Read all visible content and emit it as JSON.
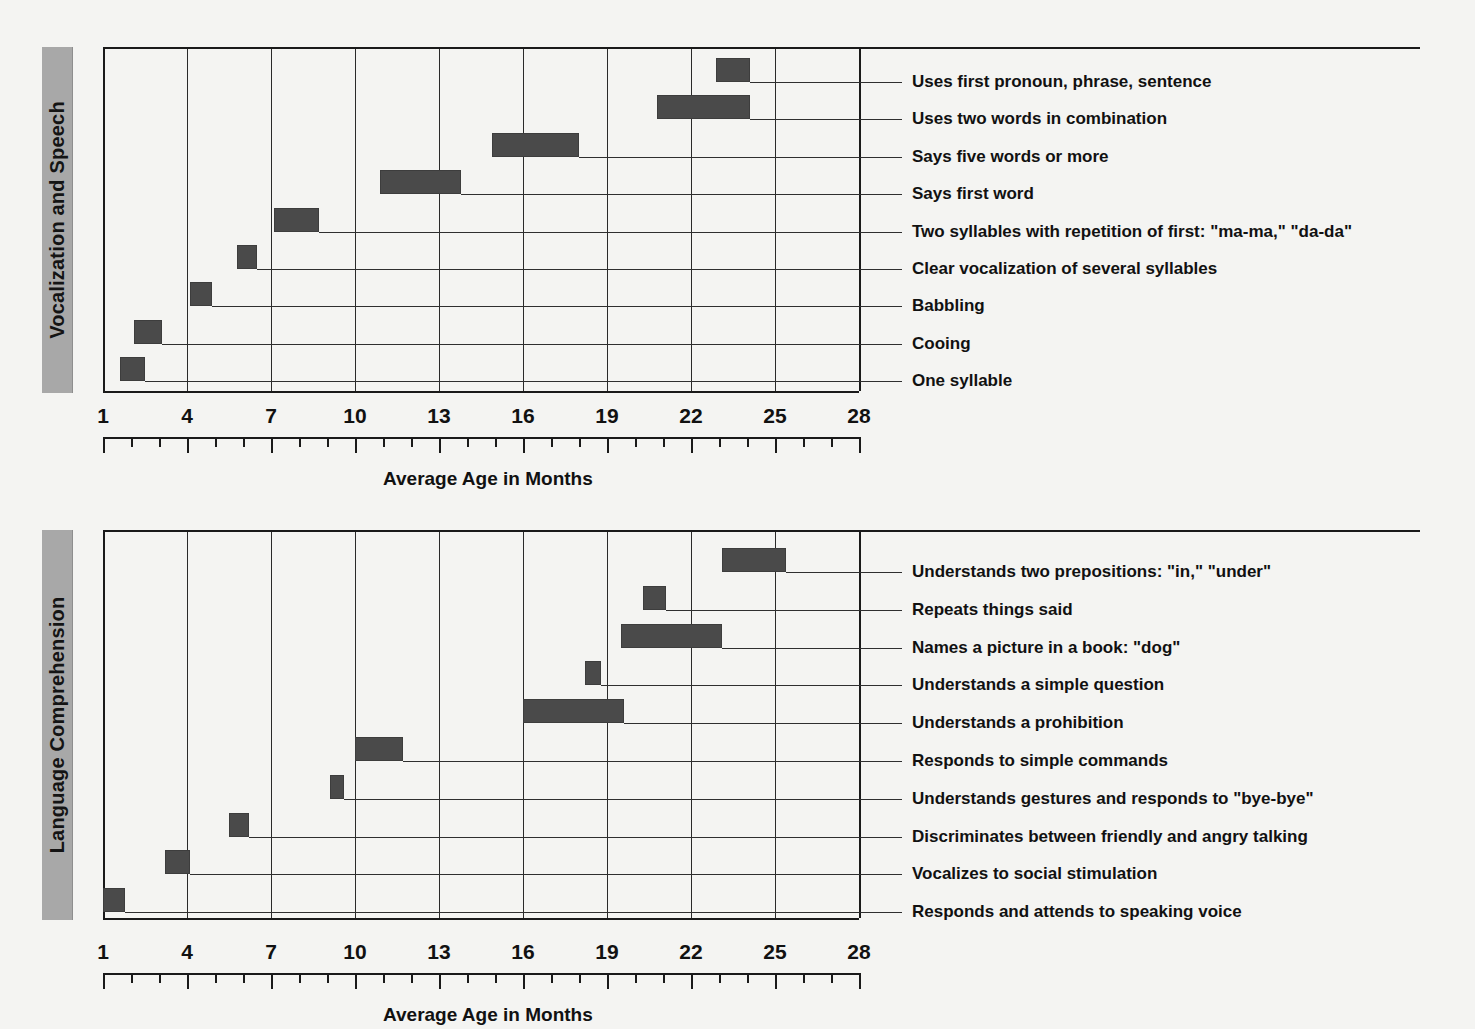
{
  "page": {
    "top_clipped_text": "",
    "background": "#f4f4f2",
    "bar_color": "#4a4a4a",
    "banner_color": "#a8a8a8",
    "axis_color": "#1a1a1a"
  },
  "axis": {
    "title": "Average Age in Months",
    "tick_labels": [
      "1",
      "4",
      "7",
      "10",
      "13",
      "16",
      "19",
      "22",
      "25",
      "28"
    ],
    "min": 1,
    "max": 28,
    "major_step": 3,
    "minor_step": 1
  },
  "charts": [
    {
      "id": "vocalization-and-speech",
      "category": "Vocalization and Speech",
      "rows": [
        {
          "label": "Uses first pronoun, phrase, sentence",
          "start": 22.9,
          "end": 24.1
        },
        {
          "label": "Uses two words in combination",
          "start": 20.8,
          "end": 24.1
        },
        {
          "label": "Says five words or more",
          "start": 14.9,
          "end": 18.0
        },
        {
          "label": "Says first word",
          "start": 10.9,
          "end": 13.8
        },
        {
          "label": "Two syllables with repetition of first: \"ma-ma,\" \"da-da\"",
          "start": 7.1,
          "end": 8.7
        },
        {
          "label": "Clear vocalization of several syllables",
          "start": 5.8,
          "end": 6.5
        },
        {
          "label": "Babbling",
          "start": 4.1,
          "end": 4.9
        },
        {
          "label": "Cooing",
          "start": 2.1,
          "end": 3.1
        },
        {
          "label": "One syllable",
          "start": 1.6,
          "end": 2.5
        }
      ]
    },
    {
      "id": "language-comprehension",
      "category": "Language Comprehension",
      "rows": [
        {
          "label": "Understands two prepositions: \"in,\" \"under\"",
          "start": 23.1,
          "end": 25.4
        },
        {
          "label": "Repeats things said",
          "start": 20.3,
          "end": 21.1
        },
        {
          "label": "Names a picture in a book: \"dog\"",
          "start": 19.5,
          "end": 23.1
        },
        {
          "label": "Understands a simple question",
          "start": 18.2,
          "end": 18.8
        },
        {
          "label": "Understands a prohibition",
          "start": 16.0,
          "end": 19.6
        },
        {
          "label": "Responds to simple commands",
          "start": 10.0,
          "end": 11.7
        },
        {
          "label": "Understands gestures and responds to \"bye-bye\"",
          "start": 9.1,
          "end": 9.6
        },
        {
          "label": "Discriminates between friendly and angry talking",
          "start": 5.5,
          "end": 6.2
        },
        {
          "label": "Vocalizes to social stimulation",
          "start": 3.2,
          "end": 4.1
        },
        {
          "label": "Responds and attends to speaking voice",
          "start": 1.0,
          "end": 1.8
        }
      ]
    }
  ],
  "chart_data": {
    "type": "bar",
    "orientation": "horizontal",
    "subtype": "range-bar",
    "title": "",
    "xlabel": "Average Age in Months",
    "ylabel": "",
    "xlim": [
      1,
      28
    ],
    "xticks": [
      1,
      4,
      7,
      10,
      13,
      16,
      19,
      22,
      25,
      28
    ],
    "minor_ticks_every": 1,
    "grid": "vertical-major-only",
    "legend": "none",
    "panels": [
      {
        "name": "Vocalization and Speech",
        "categories": [
          "Uses first pronoun, phrase, sentence",
          "Uses two words in combination",
          "Says five words or more",
          "Says first word",
          "Two syllables with repetition of first: \"ma-ma,\" \"da-da\"",
          "Clear vocalization of several syllables",
          "Babbling",
          "Cooing",
          "One syllable"
        ],
        "ranges": [
          [
            22.9,
            24.1
          ],
          [
            20.8,
            24.1
          ],
          [
            14.9,
            18.0
          ],
          [
            10.9,
            13.8
          ],
          [
            7.1,
            8.7
          ],
          [
            5.8,
            6.5
          ],
          [
            4.1,
            4.9
          ],
          [
            2.1,
            3.1
          ],
          [
            1.6,
            2.5
          ]
        ]
      },
      {
        "name": "Language Comprehension",
        "categories": [
          "Understands two prepositions: \"in,\" \"under\"",
          "Repeats things said",
          "Names a picture in a book: \"dog\"",
          "Understands a simple question",
          "Understands a prohibition",
          "Responds to simple commands",
          "Understands gestures and responds to \"bye-bye\"",
          "Discriminates between friendly and angry talking",
          "Vocalizes to social stimulation",
          "Responds and attends to speaking voice"
        ],
        "ranges": [
          [
            23.1,
            25.4
          ],
          [
            20.3,
            21.1
          ],
          [
            19.5,
            23.1
          ],
          [
            18.2,
            18.8
          ],
          [
            16.0,
            19.6
          ],
          [
            10.0,
            11.7
          ],
          [
            9.1,
            9.6
          ],
          [
            5.5,
            6.2
          ],
          [
            3.2,
            4.1
          ],
          [
            1.0,
            1.8
          ]
        ]
      }
    ]
  }
}
